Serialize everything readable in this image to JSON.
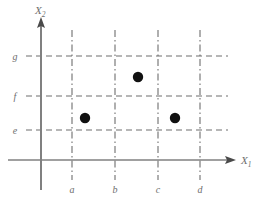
{
  "figure": {
    "title": "",
    "background_color": "#ffffff"
  },
  "chart_data": {
    "type": "scatter",
    "title": "",
    "xlabel": "X1",
    "ylabel": "X2",
    "grid": true,
    "legend": null,
    "xlim": [
      0,
      5
    ],
    "ylim": [
      0,
      5
    ],
    "x_axis": {
      "label": "X",
      "label_subscript": "1",
      "tick_labels": [
        "a",
        "b",
        "c",
        "d"
      ],
      "tick_values": [
        1,
        2,
        3,
        4
      ],
      "tick_line_style": "dash-dot"
    },
    "y_axis": {
      "label": "X",
      "label_subscript": "2",
      "tick_labels": [
        "e",
        "f",
        "g"
      ],
      "tick_values": [
        1,
        2,
        3
      ],
      "tick_line_style": "dashed"
    },
    "points": [
      {
        "id": "point-1",
        "x": 1.3,
        "y": 1.25,
        "x_px": 85,
        "y_px": 118,
        "marker": "filled-circle"
      },
      {
        "id": "point-2",
        "x": 2.55,
        "y": 2.5,
        "x_px": 138,
        "y_px": 77,
        "marker": "filled-circle"
      },
      {
        "id": "point-3",
        "x": 3.4,
        "y": 1.25,
        "x_px": 175,
        "y_px": 118,
        "marker": "filled-circle"
      }
    ],
    "colors": {
      "axis": "#808080",
      "grid": "#6e6e6e",
      "marker": "#111111",
      "label": "#6e6e6e"
    }
  },
  "labels": {
    "y_axis_main": "X",
    "y_axis_sub": "2",
    "x_axis_main": "X",
    "x_axis_sub": "1",
    "grid_y_g": "g",
    "grid_y_f": "f",
    "grid_y_e": "e",
    "grid_x_a": "a",
    "grid_x_b": "b",
    "grid_x_c": "c",
    "grid_x_d": "d"
  }
}
